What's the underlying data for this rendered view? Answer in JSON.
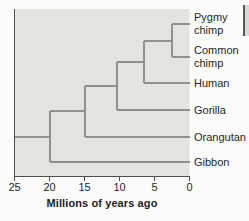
{
  "figure": {
    "type": "phylogenetic-tree",
    "taxa": [
      {
        "name": "Pygmy chimp",
        "label_lines": [
          "Pygmy",
          "chimp"
        ]
      },
      {
        "name": "Common chimp",
        "label_lines": [
          "Common",
          "chimp"
        ]
      },
      {
        "name": "Human",
        "label_lines": [
          "Human"
        ]
      },
      {
        "name": "Gorilla",
        "label_lines": [
          "Gorilla"
        ]
      },
      {
        "name": "Orangutan",
        "label_lines": [
          "Orangutan"
        ]
      },
      {
        "name": "Gibbon",
        "label_lines": [
          "Gibbon"
        ]
      }
    ],
    "divergences_mya": [
      2.5,
      6.5,
      10.3,
      15,
      20
    ],
    "root_mya": 25,
    "axis": {
      "title": "Millions of years ago",
      "ticks": [
        25,
        20,
        15,
        10,
        5,
        0
      ],
      "min": 0,
      "max": 25,
      "direction": "older-left"
    },
    "colors": {
      "plot_bg": "#e4e3e0",
      "branch": "#909090",
      "axis_line": "#4f4f4f",
      "text": "#262626",
      "page_bg": "#fcfcfb"
    }
  }
}
